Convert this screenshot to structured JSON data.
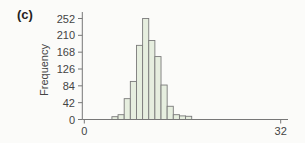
{
  "panel_label": "(c)",
  "colors": {
    "bar_fill": "#e6eedf",
    "bar_stroke": "#7a7a7a",
    "axis": "#777777",
    "text": "#444444",
    "background": "#fbfbf9"
  },
  "chart_data": {
    "type": "bar",
    "title": "",
    "xlabel": "",
    "ylabel": "Frequency",
    "x_tick_labels": [
      "0",
      "32"
    ],
    "x_ticks": [
      0,
      32
    ],
    "xlim": [
      0,
      32
    ],
    "y_ticks": [
      0,
      42,
      84,
      126,
      168,
      210,
      252
    ],
    "y_tick_labels": [
      "0",
      "42",
      "84",
      "126",
      "168",
      "210",
      "252"
    ],
    "ylim": [
      0,
      252
    ],
    "bin_width": 1,
    "categories": [
      5,
      6,
      7,
      8,
      9,
      10,
      11,
      12,
      13,
      14,
      15,
      16,
      17
    ],
    "values": [
      7,
      12,
      52,
      95,
      185,
      252,
      197,
      157,
      86,
      33,
      12,
      9,
      8
    ],
    "grid": false,
    "legend": null
  }
}
